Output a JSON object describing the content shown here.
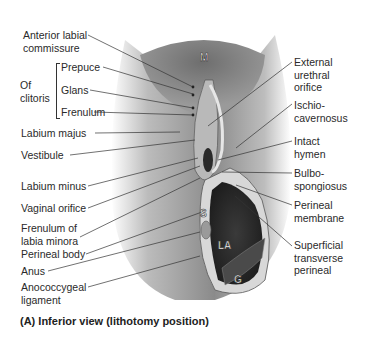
{
  "figure": {
    "caption": "(A) Inferior view (lithotomy position)",
    "region_letters": {
      "M": "M",
      "S": "S",
      "LA": "LA",
      "G": "G"
    }
  },
  "labels_left": [
    {
      "id": "anterior-labial-commissure",
      "lines": [
        "Anterior labial",
        "commissure"
      ]
    },
    {
      "id": "of-clitoris",
      "lines": [
        "Of",
        "clitoris"
      ]
    },
    {
      "id": "prepuce",
      "lines": [
        "Prepuce"
      ]
    },
    {
      "id": "glans",
      "lines": [
        "Glans"
      ]
    },
    {
      "id": "frenulum",
      "lines": [
        "Frenulum"
      ]
    },
    {
      "id": "labium-majus",
      "lines": [
        "Labium majus"
      ]
    },
    {
      "id": "vestibule",
      "lines": [
        "Vestibule"
      ]
    },
    {
      "id": "labium-minus",
      "lines": [
        "Labium minus"
      ]
    },
    {
      "id": "vaginal-orifice",
      "lines": [
        "Vaginal orifice"
      ]
    },
    {
      "id": "frenulum-of-labia-minora",
      "lines": [
        "Frenulum of",
        "labia minora"
      ]
    },
    {
      "id": "perineal-body",
      "lines": [
        "Perineal body"
      ]
    },
    {
      "id": "anus",
      "lines": [
        "Anus"
      ]
    },
    {
      "id": "anococcygeal-ligament",
      "lines": [
        "Anococcygeal",
        "ligament"
      ]
    }
  ],
  "labels_right": [
    {
      "id": "external-urethral-orifice",
      "lines": [
        "External",
        "urethral",
        "orifice"
      ]
    },
    {
      "id": "ischiocavernosus",
      "lines": [
        "Ischio-",
        "cavernosus"
      ]
    },
    {
      "id": "intact-hymen",
      "lines": [
        "Intact",
        "hymen"
      ]
    },
    {
      "id": "bulbospongiosus",
      "lines": [
        "Bulbo-",
        "spongiosus"
      ]
    },
    {
      "id": "perineal-membrane",
      "lines": [
        "Perineal",
        "membrane"
      ]
    },
    {
      "id": "superficial-transverse-perineal",
      "lines": [
        "Superficial",
        "transverse",
        "perineal"
      ]
    }
  ]
}
